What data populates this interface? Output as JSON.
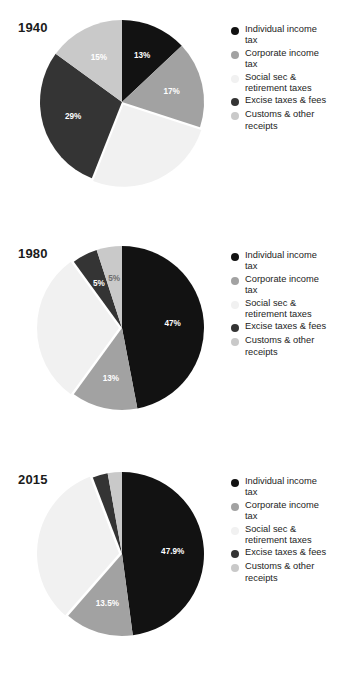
{
  "colors": {
    "individual": "#121212",
    "corporate": "#a2a2a2",
    "social": "#f1f1f1",
    "excise": "#343434",
    "customs": "#c9c9c9",
    "background": "#ffffff",
    "title_text": "#1b1b1b",
    "legend_text": "#232323",
    "label_light": "#ffffff",
    "label_gray": "#6d6d6d"
  },
  "legend": {
    "items": [
      {
        "label": "Individual income\ntax",
        "color_key": "individual",
        "bullet_name": "legend-bullet-individual-income-tax"
      },
      {
        "label": "Corporate income\ntax",
        "color_key": "corporate",
        "bullet_name": "legend-bullet-corporate-income-tax"
      },
      {
        "label": "Social sec &\nretirement taxes",
        "color_key": "social",
        "bullet_name": "legend-bullet-social-sec-retirement-taxes"
      },
      {
        "label": "Excise taxes & fees",
        "color_key": "excise",
        "bullet_name": "legend-bullet-excise-taxes-fees"
      },
      {
        "label": "Customs & other\nreceipts",
        "color_key": "customs",
        "bullet_name": "legend-bullet-customs-other-receipts"
      }
    ]
  },
  "chart_data": [
    {
      "type": "pie",
      "title": "1940",
      "categories": [
        "Individual income tax",
        "Corporate income tax",
        "Social sec & retirement taxes",
        "Excise taxes & fees",
        "Customs & other receipts"
      ],
      "values": [
        13,
        17,
        26,
        29,
        15
      ],
      "labels": [
        "13%",
        "17%",
        "",
        "29%",
        "15%"
      ],
      "color_keys": [
        "individual",
        "corporate",
        "social",
        "excise",
        "customs"
      ],
      "label_colors": [
        "label_light",
        "label_light",
        "label_light",
        "label_light",
        "label_light"
      ],
      "start_angle": 0,
      "direction": "clockwise",
      "legend_position": "right"
    },
    {
      "type": "pie",
      "title": "1980",
      "categories": [
        "Individual income tax",
        "Corporate income tax",
        "Social sec & retirement taxes",
        "Excise taxes & fees",
        "Customs & other receipts"
      ],
      "values": [
        47,
        13,
        30,
        5,
        5
      ],
      "labels": [
        "47%",
        "13%",
        "",
        "5%",
        "5%"
      ],
      "color_keys": [
        "individual",
        "corporate",
        "social",
        "excise",
        "customs"
      ],
      "label_colors": [
        "label_light",
        "label_light",
        "label_light",
        "label_light",
        "label_gray"
      ],
      "start_angle": 0,
      "direction": "clockwise",
      "legend_position": "right"
    },
    {
      "type": "pie",
      "title": "2015",
      "categories": [
        "Individual income tax",
        "Corporate income tax",
        "Social sec & retirement taxes",
        "Excise taxes & fees",
        "Customs & other receipts"
      ],
      "values": [
        47.9,
        13.5,
        32.8,
        3.0,
        2.8
      ],
      "labels": [
        "47.9%",
        "13.5%",
        "",
        "",
        ""
      ],
      "color_keys": [
        "individual",
        "corporate",
        "social",
        "excise",
        "customs"
      ],
      "label_colors": [
        "label_light",
        "label_light",
        "label_light",
        "label_light",
        "label_gray"
      ],
      "start_angle": 0,
      "direction": "clockwise",
      "legend_position": "right"
    }
  ]
}
